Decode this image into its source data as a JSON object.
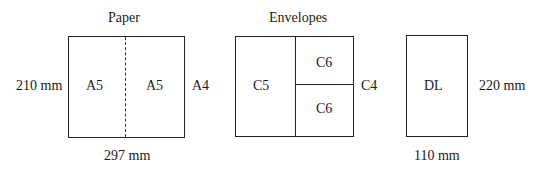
{
  "paper": {
    "title": "Paper",
    "height_label": "210 mm",
    "width_label": "297 mm",
    "sheet_label": "A4",
    "halves": [
      "A5",
      "A5"
    ]
  },
  "envelopes": {
    "title": "Envelopes",
    "large_label": "C5",
    "small_labels": [
      "C6",
      "C6"
    ],
    "outer_label": "C4"
  },
  "dl": {
    "label": "DL",
    "height_label": "220 mm",
    "width_label": "110 mm"
  }
}
